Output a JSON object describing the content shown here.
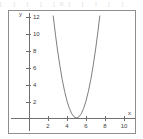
{
  "top_strip": {
    "text": "[    ]    [    ]    [0]   [    ]    [    ]"
  },
  "chart_data": {
    "type": "line",
    "title": "",
    "subtitle": "",
    "xlabel": "x",
    "ylabel": "y",
    "xlim": [
      -0.9,
      11.6
    ],
    "ylim": [
      -0.9,
      12.9
    ],
    "xticks": [
      2,
      4,
      6,
      8,
      10
    ],
    "xticklabels": [
      "2",
      "4",
      "6",
      "8",
      "10"
    ],
    "yticks": [
      2,
      4,
      6,
      8,
      10,
      12
    ],
    "yticklabels": [
      "2",
      "4",
      "6",
      "8",
      "10",
      "12"
    ],
    "grid": false,
    "legend": null,
    "curve_color": "#6f6f6f",
    "axis_color": "#6f6f6f",
    "frame_color": "#8d8d8d",
    "vertex": [
      5,
      0
    ],
    "equation": "y = 2(x - 5)^2",
    "series": [
      {
        "name": "parabola",
        "x": [
          2.55,
          2.8,
          3.0,
          3.25,
          3.5,
          3.75,
          4.0,
          4.25,
          4.5,
          4.75,
          5.0,
          5.25,
          5.5,
          5.75,
          6.0,
          6.25,
          6.5,
          6.75,
          7.0,
          7.25,
          7.45
        ],
        "y": [
          12.0,
          9.68,
          8.0,
          6.13,
          4.5,
          3.13,
          2.0,
          1.13,
          0.5,
          0.13,
          0.0,
          0.13,
          0.5,
          1.13,
          2.0,
          3.13,
          4.5,
          6.13,
          8.0,
          10.13,
          12.0
        ]
      }
    ]
  }
}
